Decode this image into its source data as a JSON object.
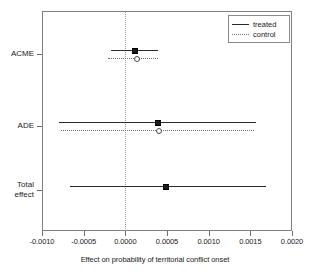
{
  "chart_data": {
    "type": "errorbar",
    "title": "",
    "xlabel": "Effect on probability of territorial conflict onset",
    "ylabel": "",
    "xlim": [
      -0.001,
      0.002
    ],
    "ylim": [
      0,
      3
    ],
    "grid": false,
    "zero_reference_line": 0.0,
    "legend_position": "top-right",
    "categories": [
      "ACME",
      "ADE",
      "Total effect"
    ],
    "xticks": [
      -0.001,
      -0.0005,
      0.0,
      0.0005,
      0.001,
      0.0015,
      0.002
    ],
    "xticklabels": [
      "-0.0010",
      "-0.0005",
      "0.0000",
      "0.0005",
      "0.0010",
      "0.0015",
      "0.0020"
    ],
    "yticklabels": [
      "ACME",
      "ADE",
      "Total effect"
    ],
    "series": [
      {
        "name": "treated",
        "style": "solid",
        "marker": "filled-square",
        "color": "#2b2b2b",
        "points": [
          {
            "category": "ACME",
            "estimate": 0.0001,
            "ci_low": -0.000175,
            "ci_high": 0.000388
          },
          {
            "category": "ADE",
            "estimate": 0.000375,
            "ci_low": -0.0008,
            "ci_high": 0.001563
          },
          {
            "category": "Total effect",
            "estimate": 0.000475,
            "ci_low": -0.000663,
            "ci_high": 0.001688
          }
        ]
      },
      {
        "name": "control",
        "style": "dotted",
        "marker": "open-circle",
        "color": "#6f6f6f",
        "points": [
          {
            "category": "ACME",
            "estimate": 0.000125,
            "ci_low": -0.000213,
            "ci_high": 0.000388
          },
          {
            "category": "ADE",
            "estimate": 0.000388,
            "ci_low": -0.000775,
            "ci_high": 0.001538
          }
        ]
      }
    ]
  },
  "legend": {
    "entries": [
      {
        "label": "treated"
      },
      {
        "label": "control"
      }
    ]
  },
  "axis": {
    "x_title": "Effect on probability of territorial conflict onset",
    "tick_labels": [
      "-0.0010",
      "-0.0005",
      "0.0000",
      "0.0005",
      "0.0010",
      "0.0015",
      "0.0020"
    ],
    "category_labels": [
      "ACME",
      "ADE",
      "Total",
      "effect"
    ]
  }
}
